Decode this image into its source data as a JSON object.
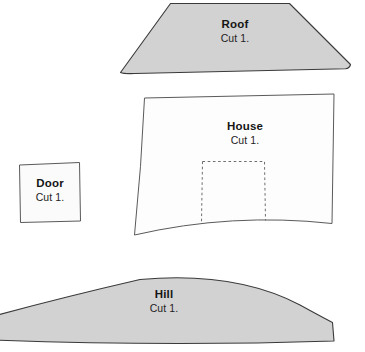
{
  "sheet": {
    "title": "Craft Pattern Template Sheet",
    "width": 365,
    "height": 352,
    "background_color": "#ffffff"
  },
  "style": {
    "filled_color": "#d2d2d2",
    "unfilled_color": "#fdfdfd",
    "outline_color": "#3a3a3a",
    "dashed_color": "#6e6e6e",
    "text_color": "#151515"
  },
  "pieces": [
    {
      "id": "roof",
      "name": "Roof",
      "quantity_label": "Cut 1.",
      "fill": "filled",
      "shape": "trapezoid-curved-base"
    },
    {
      "id": "house",
      "name": "House",
      "quantity_label": "Cut 1.",
      "fill": "unfilled",
      "shape": "quadrilateral-curved-base",
      "has_dashed_door_outline": true
    },
    {
      "id": "door",
      "name": "Door",
      "quantity_label": "Cut 1.",
      "fill": "unfilled",
      "shape": "skewed-rectangle"
    },
    {
      "id": "hill",
      "name": "Hill",
      "quantity_label": "Cut 1.",
      "fill": "filled",
      "shape": "arched-mound"
    }
  ]
}
